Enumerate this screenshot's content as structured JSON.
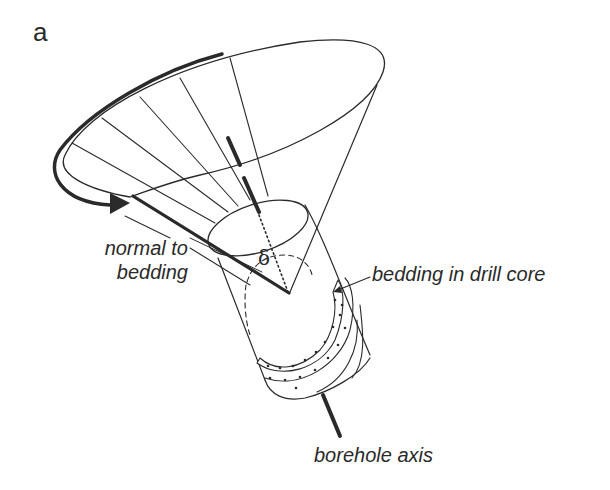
{
  "figure": {
    "panel_label": "a",
    "labels": {
      "normal_line1": "normal to",
      "normal_line2": "bedding",
      "bedding": "bedding in drill core",
      "borehole": "borehole axis",
      "angle": "δ"
    },
    "colors": {
      "line": "#2a2a2a",
      "background": "#ffffff"
    },
    "elements": [
      "cone of possible bedding normals",
      "rotation arrow around cone rim",
      "drill core cylinder",
      "stippled bedding layer in core",
      "borehole axis (thick dashed line)",
      "normal to bedding (thick line)",
      "angle delta between borehole axis and bedding normal"
    ]
  }
}
